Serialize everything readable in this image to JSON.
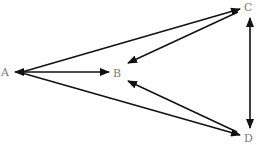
{
  "diagram": {
    "type": "directed-graph",
    "nodes": [
      {
        "id": "A",
        "label": "A",
        "x": 6,
        "y": 72
      },
      {
        "id": "B",
        "label": "B",
        "x": 118,
        "y": 73
      },
      {
        "id": "C",
        "label": "C",
        "x": 248,
        "y": 8
      },
      {
        "id": "D",
        "label": "D",
        "x": 248,
        "y": 136
      }
    ],
    "edges": [
      {
        "from": "A",
        "to": "B",
        "bidirectional": true
      },
      {
        "from": "A",
        "to": "C",
        "bidirectional": false
      },
      {
        "from": "C",
        "to": "B",
        "bidirectional": false
      },
      {
        "from": "A",
        "to": "D",
        "bidirectional": false
      },
      {
        "from": "D",
        "to": "B",
        "bidirectional": false
      },
      {
        "from": "C",
        "to": "D",
        "bidirectional": true
      }
    ],
    "colors": {
      "edge": "#111111",
      "label": "#7a7a7a",
      "background": "#ffffff"
    }
  }
}
